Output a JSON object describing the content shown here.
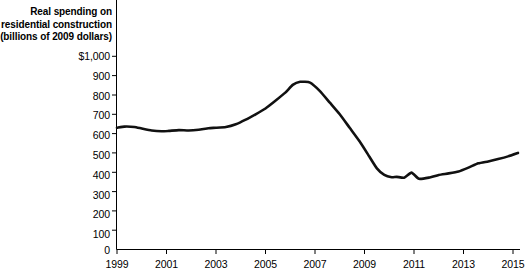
{
  "chart_data": {
    "type": "line",
    "title": "",
    "ylabel_lines": [
      "Real spending on",
      "residential construction",
      "(billions of 2009 dollars)"
    ],
    "xlabel": "",
    "ylabel": "Real spending on residential construction (billions of 2009 dollars)",
    "ylim": [
      0,
      1000
    ],
    "xlim": [
      1999,
      2015.5
    ],
    "grid": false,
    "legend": "none",
    "line_color": "#111111",
    "ytick_labels": [
      "$1,000",
      "900",
      "800",
      "700",
      "600",
      "500",
      "400",
      "300",
      "200",
      "100",
      "0"
    ],
    "ytick_values": [
      1000,
      900,
      800,
      700,
      600,
      500,
      400,
      300,
      200,
      100,
      0
    ],
    "xtick_labels": [
      "1999",
      "2001",
      "2003",
      "2005",
      "2007",
      "2009",
      "2011",
      "2013",
      "2015"
    ],
    "xtick_values": [
      1999,
      2001,
      2003,
      2005,
      2007,
      2009,
      2011,
      2013,
      2015
    ],
    "series": [
      {
        "name": "Real spending on residential construction",
        "x": [
          1999.0,
          1999.25,
          1999.5,
          1999.75,
          2000.0,
          2000.25,
          2000.5,
          2000.75,
          2001.0,
          2001.25,
          2001.5,
          2001.75,
          2002.0,
          2002.25,
          2002.5,
          2002.75,
          2003.0,
          2003.25,
          2003.5,
          2003.75,
          2004.0,
          2004.25,
          2004.5,
          2004.75,
          2005.0,
          2005.25,
          2005.5,
          2005.75,
          2006.0,
          2006.25,
          2006.5,
          2006.75,
          2007.0,
          2007.25,
          2007.5,
          2007.75,
          2008.0,
          2008.25,
          2008.5,
          2008.75,
          2009.0,
          2009.25,
          2009.5,
          2009.75,
          2010.0,
          2010.25,
          2010.5,
          2010.75,
          2011.0,
          2011.25,
          2011.5,
          2011.75,
          2012.0,
          2012.25,
          2012.5,
          2012.75,
          2013.0,
          2013.25,
          2013.5,
          2013.75,
          2014.0,
          2014.25,
          2014.5,
          2014.75,
          2015.0,
          2015.25
        ],
        "values": [
          628,
          632,
          636,
          638,
          634,
          628,
          620,
          616,
          614,
          616,
          620,
          618,
          622,
          628,
          634,
          640,
          644,
          640,
          648,
          668,
          686,
          700,
          716,
          728,
          742,
          762,
          784,
          800,
          822,
          836,
          846,
          856,
          862,
          868,
          870,
          866,
          862,
          846,
          820,
          790,
          762,
          728,
          690,
          652,
          618,
          586,
          548,
          512,
          480,
          452,
          428,
          408,
          392,
          382,
          378,
          380,
          378,
          374,
          372,
          380,
          396,
          388,
          372,
          358,
          356,
          360
        ]
      }
    ],
    "annotations": [],
    "peak": {
      "year": 2006.5,
      "value": 870
    },
    "trough": {
      "year": 2011.0,
      "value": 356
    },
    "end": {
      "year": 2015.25,
      "value": 500
    }
  },
  "chart_series_full": {
    "x": [
      1999.0,
      1999.3,
      1999.7,
      2000.0,
      2000.4,
      2000.8,
      2001.1,
      2001.5,
      2001.9,
      2002.3,
      2002.7,
      2003.0,
      2003.4,
      2003.8,
      2004.2,
      2004.6,
      2005.0,
      2005.4,
      2005.8,
      2006.1,
      2006.4,
      2006.8,
      2007.2,
      2007.6,
      2008.0,
      2008.4,
      2008.8,
      2009.2,
      2009.5,
      2009.8,
      2010.1,
      2010.3,
      2010.6,
      2010.9,
      2011.2,
      2011.6,
      2012.0,
      2012.4,
      2012.8,
      2013.2,
      2013.6,
      2014.0,
      2014.4,
      2014.8,
      2015.2
    ],
    "y": [
      630,
      636,
      634,
      626,
      616,
      612,
      614,
      618,
      616,
      620,
      628,
      630,
      634,
      648,
      672,
      700,
      730,
      770,
      812,
      852,
      868,
      864,
      820,
      760,
      700,
      630,
      560,
      480,
      420,
      386,
      374,
      376,
      372,
      398,
      366,
      372,
      386,
      394,
      404,
      424,
      446,
      456,
      468,
      482,
      500
    ]
  }
}
